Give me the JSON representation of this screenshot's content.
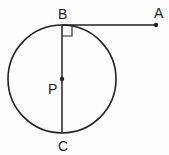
{
  "diagram": {
    "type": "geometry",
    "stroke_color": "#222222",
    "circle": {
      "center": "P",
      "cx": 62,
      "cy": 79,
      "r": 54
    },
    "points": {
      "A": {
        "label": "A",
        "x": 156,
        "y": 25
      },
      "B": {
        "label": "B",
        "x": 62,
        "y": 25
      },
      "C": {
        "label": "C",
        "x": 62,
        "y": 133
      },
      "P": {
        "label": "P",
        "x": 62,
        "y": 79
      }
    },
    "segments": [
      {
        "from": "B",
        "to": "A",
        "role": "tangent"
      },
      {
        "from": "B",
        "to": "C",
        "role": "diameter"
      }
    ],
    "right_angle_marker": {
      "at": "B",
      "between": [
        "BA",
        "BC"
      ],
      "size": 10
    }
  }
}
